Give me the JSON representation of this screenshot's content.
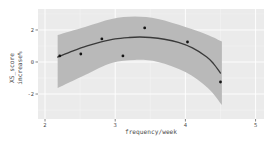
{
  "chart_data": {
    "type": "scatter",
    "title": "",
    "xlabel": "frequency/week",
    "ylabel": "XS_score increase%",
    "ylabel_lines": [
      "XS_score",
      "increase%"
    ],
    "xlim": [
      1.9,
      5.12
    ],
    "ylim": [
      -3.56,
      3.31
    ],
    "x_ticks": [
      2,
      3,
      4,
      5
    ],
    "x_minor_ticks": [
      2.5,
      3.5,
      4.5
    ],
    "y_ticks": [
      -2,
      0,
      2
    ],
    "y_minor_ticks": [
      -3,
      -1,
      1,
      3
    ],
    "grid": "white major+minor gridlines on gray panel",
    "legend": "none",
    "points": [
      {
        "x": 2.21,
        "y": 0.38
      },
      {
        "x": 2.51,
        "y": 0.5
      },
      {
        "x": 2.81,
        "y": 1.44
      },
      {
        "x": 3.11,
        "y": 0.38
      },
      {
        "x": 3.42,
        "y": 2.13
      },
      {
        "x": 4.03,
        "y": 1.25
      },
      {
        "x": 4.5,
        "y": -1.25
      }
    ],
    "fit_line": [
      [
        2.18,
        0.31
      ],
      [
        2.4,
        0.69
      ],
      [
        2.6,
        1.0
      ],
      [
        2.8,
        1.25
      ],
      [
        3.0,
        1.44
      ],
      [
        3.2,
        1.53
      ],
      [
        3.35,
        1.56
      ],
      [
        3.5,
        1.53
      ],
      [
        3.7,
        1.42
      ],
      [
        3.9,
        1.22
      ],
      [
        4.1,
        0.88
      ],
      [
        4.3,
        0.33
      ],
      [
        4.4,
        -0.1
      ],
      [
        4.5,
        -0.69
      ]
    ],
    "ci_ribbon": {
      "top": [
        [
          2.18,
          1.69
        ],
        [
          2.57,
          2.19
        ],
        [
          2.95,
          2.69
        ],
        [
          3.28,
          2.84
        ],
        [
          3.61,
          2.69
        ],
        [
          4.0,
          2.19
        ],
        [
          4.32,
          1.69
        ],
        [
          4.52,
          1.28
        ]
      ],
      "bottom": [
        [
          2.18,
          -1.63
        ],
        [
          2.57,
          -0.81
        ],
        [
          2.95,
          -0.06
        ],
        [
          3.28,
          0.13
        ],
        [
          3.61,
          0.0
        ],
        [
          4.0,
          -0.63
        ],
        [
          4.32,
          -1.63
        ],
        [
          4.52,
          -2.69
        ]
      ]
    },
    "colors": {
      "figure_bg": "#ffffff",
      "panel_bg": "#ebebeb",
      "grid_major": "#ffffff",
      "grid_minor": "#f4f4f4",
      "ribbon": "#b9b9b9",
      "fit_line": "#3a3a3a",
      "point": "#141414",
      "tick": "#333333",
      "text": "#4d4d4d"
    }
  }
}
